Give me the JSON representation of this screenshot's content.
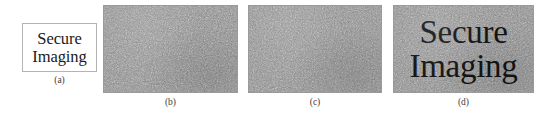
{
  "figure": {
    "panels": [
      {
        "id": "a",
        "caption": "(a)",
        "kind": "plaintext-box",
        "text_lines": [
          "Secure",
          "Imaging"
        ],
        "background_color": "#ffffff",
        "border_color": "#b4b4b4",
        "text_color": "#1a1a1a"
      },
      {
        "id": "b",
        "caption": "(b)",
        "kind": "noise",
        "text_lines": [],
        "background_color": "#838383",
        "border_color": "#9a9a9a"
      },
      {
        "id": "c",
        "caption": "(c)",
        "kind": "noise",
        "text_lines": [],
        "background_color": "#838383",
        "border_color": "#9a9a9a"
      },
      {
        "id": "d",
        "caption": "(d)",
        "kind": "noise-with-text",
        "text_lines": [
          "Secure",
          "Imaging"
        ],
        "background_color": "#838383",
        "border_color": "#9a9a9a",
        "text_color": "#141414"
      }
    ]
  }
}
